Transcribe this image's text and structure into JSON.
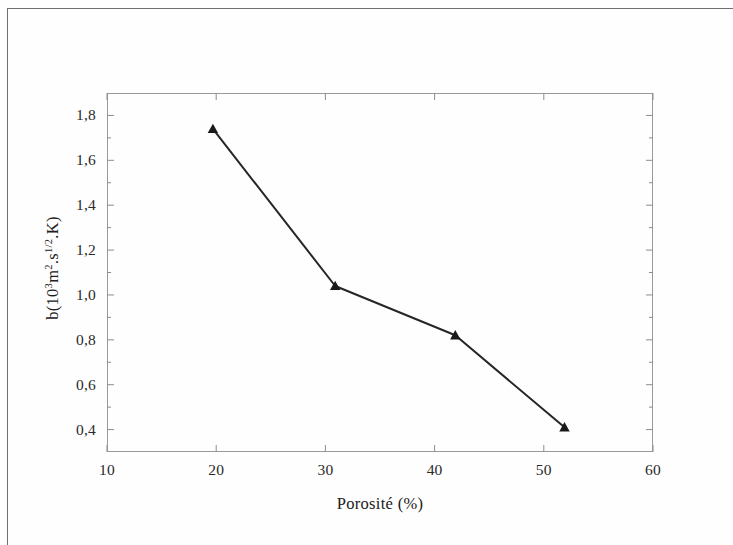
{
  "figure": {
    "x_axis_title": "Porosité (%)",
    "y_axis_title_prefix": "b(10",
    "y_axis_title_exp1": "3",
    "y_axis_title_mid": "m",
    "y_axis_title_exp2": "2",
    "y_axis_title_mid2": ".s",
    "y_axis_title_exp3": "1/2",
    "y_axis_title_suffix": ".K)"
  },
  "chart_data": {
    "type": "line",
    "title": "",
    "xlabel": "Porosité (%)",
    "ylabel": "b(10^3 m^2.s^1/2.K)",
    "xlim": [
      10,
      60
    ],
    "ylim": [
      0.3,
      1.9
    ],
    "xticks": [
      10,
      20,
      30,
      40,
      50,
      60
    ],
    "xtick_labels": [
      "10",
      "20",
      "30",
      "40",
      "50",
      "60"
    ],
    "yticks": [
      0.4,
      0.6,
      0.8,
      1.0,
      1.2,
      1.4,
      1.6,
      1.8
    ],
    "ytick_labels": [
      "0,4",
      "0,6",
      "0,8",
      "1,0",
      "1,2",
      "1,4",
      "1,6",
      "1,8"
    ],
    "yticks_minor": [
      0.5,
      0.7,
      0.9,
      1.1,
      1.3,
      1.5,
      1.7
    ],
    "grid": false,
    "legend": null,
    "marker": "triangle",
    "line_color": "#262626",
    "marker_color": "#1a1a1a",
    "series": [
      {
        "name": "b vs porosité",
        "x": [
          19.7,
          30.9,
          41.9,
          51.9
        ],
        "y": [
          1.74,
          1.04,
          0.82,
          0.41
        ]
      }
    ]
  }
}
